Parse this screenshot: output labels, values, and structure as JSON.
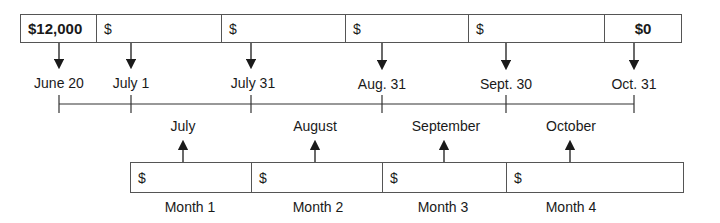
{
  "top_row": {
    "cells": [
      {
        "text": "$12,000",
        "bold": true
      },
      {
        "text": "$",
        "bold": false
      },
      {
        "text": "$",
        "bold": false
      },
      {
        "text": "$",
        "bold": false
      },
      {
        "text": "$",
        "bold": false
      },
      {
        "text": "$0",
        "bold": true
      }
    ]
  },
  "dates": [
    "June 20",
    "July 1",
    "July 31",
    "Aug. 31",
    "Sept. 30",
    "Oct. 31"
  ],
  "months": [
    "July",
    "August",
    "September",
    "October"
  ],
  "bottom_row": {
    "cells": [
      "$",
      "$",
      "$",
      "$"
    ],
    "labels": [
      "Month 1",
      "Month 2",
      "Month 3",
      "Month 4"
    ]
  }
}
